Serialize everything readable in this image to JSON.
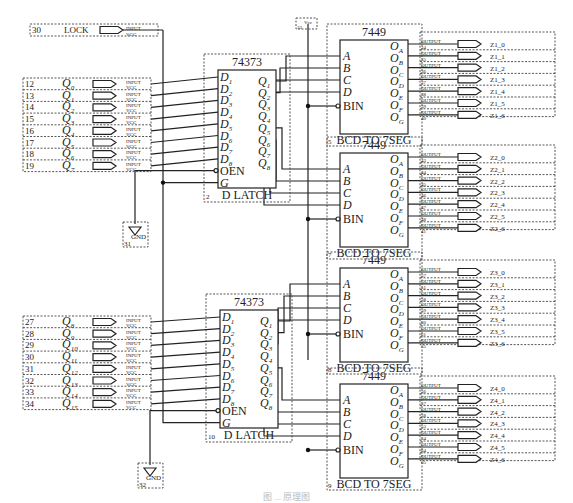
{
  "lock": {
    "pin": "30",
    "label": "LOCK",
    "port": "INPUT",
    "supply": "VCC"
  },
  "vcc": {
    "pin": "33",
    "label": "Vcc"
  },
  "gnd": [
    {
      "pin": "31",
      "label": "GND"
    },
    {
      "pin": "32",
      "label": "GND"
    }
  ],
  "input_groups": [
    {
      "port": "INPUT",
      "supply": "VCC",
      "rows": [
        {
          "pin": "12",
          "name": "Q",
          "sub": "0"
        },
        {
          "pin": "13",
          "name": "Q",
          "sub": "1"
        },
        {
          "pin": "14",
          "name": "Q",
          "sub": "2"
        },
        {
          "pin": "15",
          "name": "Q",
          "sub": "3"
        },
        {
          "pin": "16",
          "name": "Q",
          "sub": "4"
        },
        {
          "pin": "17",
          "name": "Q",
          "sub": "5"
        },
        {
          "pin": "18",
          "name": "Q",
          "sub": "6"
        },
        {
          "pin": "19",
          "name": "Q",
          "sub": "7"
        }
      ]
    },
    {
      "port": "INPUT",
      "supply": "VCC",
      "rows": [
        {
          "pin": "27",
          "name": "Q",
          "sub": "8"
        },
        {
          "pin": "28",
          "name": "Q",
          "sub": "9"
        },
        {
          "pin": "29",
          "name": "Q",
          "sub": "10"
        },
        {
          "pin": "30",
          "name": "Q",
          "sub": "11"
        },
        {
          "pin": "31",
          "name": "Q",
          "sub": "12"
        },
        {
          "pin": "32",
          "name": "Q",
          "sub": "13"
        },
        {
          "pin": "33",
          "name": "Q",
          "sub": "14"
        },
        {
          "pin": "34",
          "name": "Q",
          "sub": "15"
        }
      ]
    }
  ],
  "latches": [
    {
      "part": "74373",
      "ref": "2",
      "function": "D LATCH",
      "inputs": [
        "1",
        "2",
        "3",
        "4",
        "5",
        "6",
        "7",
        "8"
      ],
      "outputs": [
        "1",
        "2",
        "3",
        "4",
        "5",
        "6",
        "7",
        "8"
      ],
      "oen": "OEN",
      "g": "G"
    },
    {
      "part": "74373",
      "ref": "10",
      "function": "D LATCH",
      "inputs": [
        "1",
        "2",
        "3",
        "4",
        "5",
        "6",
        "7",
        "8"
      ],
      "outputs": [
        "1",
        "2",
        "3",
        "4",
        "5",
        "6",
        "7",
        "8"
      ],
      "oen": "OEN",
      "g": "G"
    }
  ],
  "decoders": [
    {
      "part": "7449",
      "ref": "5",
      "function": "BCD TO 7SEG",
      "inputs": [
        "A",
        "B",
        "C",
        "D"
      ],
      "bin": "BIN",
      "outputs": [
        "A",
        "B",
        "C",
        "D",
        "E",
        "F",
        "G"
      ],
      "out_pins": [
        "34",
        "35",
        "36",
        "37",
        "38",
        "39",
        "40"
      ],
      "nets": [
        "Z1_0",
        "Z1_1",
        "Z1_2",
        "Z1_3",
        "Z1_4",
        "Z1_5",
        "Z1_6"
      ]
    },
    {
      "part": "7449",
      "ref": "7",
      "function": "BCD TO 7SEG",
      "inputs": [
        "A",
        "B",
        "C",
        "D"
      ],
      "bin": "BIN",
      "outputs": [
        "A",
        "B",
        "C",
        "D",
        "E",
        "F",
        "G"
      ],
      "out_pins": [
        "43",
        "44",
        "45",
        "46",
        "47",
        "48",
        "41"
      ],
      "nets": [
        "Z2_0",
        "Z2_1",
        "Z2_2",
        "Z2_3",
        "Z2_4",
        "Z2_5",
        "Z2_6"
      ]
    },
    {
      "part": "7449",
      "ref": "8",
      "function": "BCD TO 7SEG",
      "inputs": [
        "A",
        "B",
        "C",
        "D"
      ],
      "bin": "BIN",
      "outputs": [
        "A",
        "B",
        "C",
        "D",
        "E",
        "F",
        "G"
      ],
      "out_pins": [
        "57",
        "51",
        "58",
        "59",
        "60",
        "61",
        "55"
      ],
      "nets": [
        "Z3_0",
        "Z3_1",
        "Z3_2",
        "Z3_3",
        "Z3_4",
        "Z3_5",
        "Z3_6"
      ]
    },
    {
      "part": "7449",
      "ref": "9",
      "function": "BCD TO 7SEG",
      "inputs": [
        "A",
        "B",
        "C",
        "D"
      ],
      "bin": "BIN",
      "outputs": [
        "A",
        "B",
        "C",
        "D",
        "E",
        "F",
        "G"
      ],
      "out_pins": [
        "56",
        "57",
        "58",
        "53",
        "54",
        "64",
        "65"
      ],
      "nets": [
        "Z4_0",
        "Z4_1",
        "Z4_2",
        "Z4_3",
        "Z4_4",
        "Z4_5",
        "Z4_6"
      ]
    }
  ],
  "output_port": "OUTPUT",
  "caption": "图 ... 原理图"
}
